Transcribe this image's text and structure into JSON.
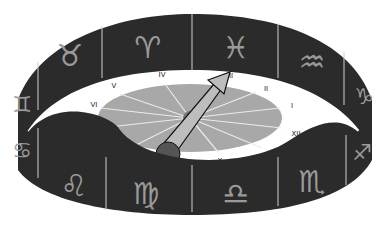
{
  "illustration": {
    "subject": "zodiac band encircling a sundial",
    "colors": {
      "band": "#2a2a2a",
      "dial": "#a8a8a8",
      "divider": "#cfcfcf",
      "glyph": "#9a9a9a"
    },
    "zodiac_back": [
      {
        "name": "gemini",
        "symbol": "♊"
      },
      {
        "name": "taurus",
        "symbol": "♉"
      },
      {
        "name": "aries",
        "symbol": "♈"
      },
      {
        "name": "pisces",
        "symbol": "♓"
      },
      {
        "name": "aquarius",
        "symbol": "♒"
      },
      {
        "name": "capricorn",
        "symbol": "♑"
      }
    ],
    "zodiac_front": [
      {
        "name": "cancer",
        "symbol": "♋"
      },
      {
        "name": "leo",
        "symbol": "♌"
      },
      {
        "name": "virgo",
        "symbol": "♍"
      },
      {
        "name": "libra",
        "symbol": "♎"
      },
      {
        "name": "scorpio",
        "symbol": "♏"
      },
      {
        "name": "sagittarius",
        "symbol": "♐"
      }
    ],
    "hours": [
      "I",
      "II",
      "III",
      "IV",
      "V",
      "VI",
      "VII",
      "VIII",
      "IX",
      "X",
      "XI",
      "XII"
    ],
    "pointer_target": "III"
  }
}
